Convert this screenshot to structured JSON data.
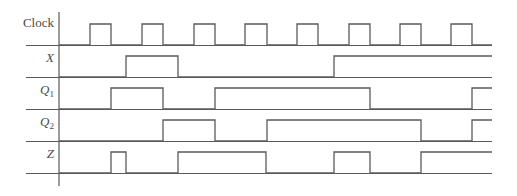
{
  "diagram": {
    "stroke_color": "#5a5a5a",
    "axis": {
      "x": 59,
      "y_top": 12,
      "y_bottom": 186
    },
    "line_start_x": 26,
    "line_end_x": 492,
    "signals": [
      {
        "id": "clock",
        "label": "Clock",
        "subscript": "",
        "italic": false,
        "label_y": 23,
        "high_y": 24,
        "low_y": 45,
        "initial": 0,
        "transitions": [
          90,
          111,
          142,
          163,
          194,
          215,
          245,
          267,
          297,
          318,
          349,
          370,
          400,
          421,
          451,
          472
        ]
      },
      {
        "id": "x",
        "label": "X",
        "subscript": "",
        "italic": true,
        "label_y": 58,
        "high_y": 56,
        "low_y": 77,
        "initial": 0,
        "transitions": [
          126,
          178,
          334
        ]
      },
      {
        "id": "q1",
        "label": "Q",
        "subscript": "1",
        "italic": true,
        "label_y": 90,
        "high_y": 88,
        "low_y": 109,
        "initial": 0,
        "transitions": [
          111,
          163,
          215,
          370,
          472
        ]
      },
      {
        "id": "q2",
        "label": "Q",
        "subscript": "2",
        "italic": true,
        "label_y": 122,
        "high_y": 120,
        "low_y": 141,
        "initial": 0,
        "transitions": [
          163,
          215,
          267,
          421,
          472
        ]
      },
      {
        "id": "z",
        "label": "Z",
        "subscript": "",
        "italic": true,
        "label_y": 154,
        "high_y": 152,
        "low_y": 173,
        "initial": 0,
        "transitions": [
          111,
          126,
          178,
          266,
          334,
          370,
          421
        ]
      }
    ]
  }
}
